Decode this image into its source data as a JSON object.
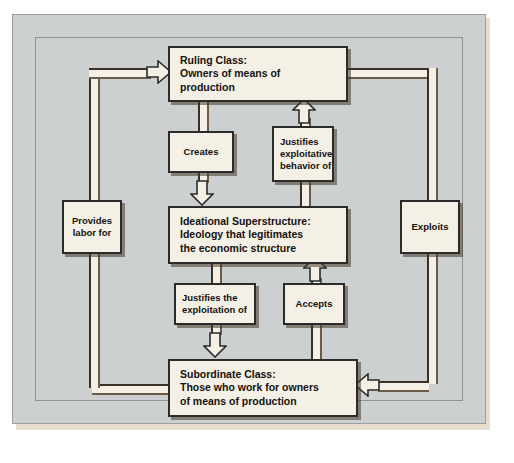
{
  "diagram": {
    "type": "flow-diagram",
    "colors": {
      "plate_background": "#ccd0d0",
      "box_fill": "#f4f0e6",
      "outline": "#2b2b2b",
      "shadow": "#463728",
      "paper_edge": "#e8dccb"
    },
    "nodes": [
      {
        "id": "ruling",
        "lines": [
          "Ruling Class:",
          "Owners of means of",
          "production"
        ]
      },
      {
        "id": "ideational",
        "lines": [
          "Ideational Superstructure:",
          "Ideology that legitimates",
          "the economic structure"
        ]
      },
      {
        "id": "subordinate",
        "lines": [
          "Subordinate Class:",
          "Those who work for owners",
          "of means of production"
        ]
      }
    ],
    "edge_labels": [
      {
        "id": "creates",
        "lines": [
          "Creates"
        ]
      },
      {
        "id": "justifies_exploitative",
        "lines": [
          "Justifies",
          "exploitative",
          "behavior of"
        ]
      },
      {
        "id": "provides_labor",
        "lines": [
          "Provides",
          "labor for"
        ]
      },
      {
        "id": "exploits",
        "lines": [
          "Exploits"
        ]
      },
      {
        "id": "justifies_exploitation",
        "lines": [
          "Justifies the",
          "exploitation of"
        ]
      },
      {
        "id": "accepts",
        "lines": [
          "Accepts"
        ]
      }
    ],
    "edges": [
      {
        "from": "ruling",
        "to": "ideational",
        "label": "creates",
        "direction": "down"
      },
      {
        "from": "ideational",
        "to": "ruling",
        "label": "justifies_exploitative",
        "direction": "up"
      },
      {
        "from": "ideational",
        "to": "subordinate",
        "label": "justifies_exploitation",
        "direction": "down"
      },
      {
        "from": "subordinate",
        "to": "ideational",
        "label": "accepts",
        "direction": "up"
      },
      {
        "from": "subordinate",
        "to": "ruling",
        "label": "provides_labor",
        "direction": "up-left"
      },
      {
        "from": "ruling",
        "to": "subordinate",
        "label": "exploits",
        "direction": "down-right"
      }
    ]
  }
}
